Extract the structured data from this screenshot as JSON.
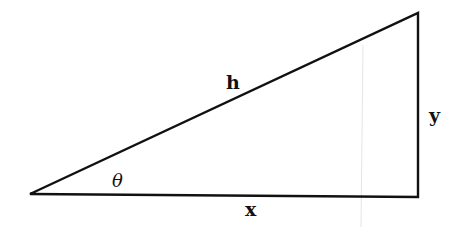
{
  "diagram": {
    "type": "right-triangle",
    "vertices": {
      "angle_vertex": [
        30,
        194
      ],
      "top_right": [
        418,
        13
      ],
      "right_angle": [
        418,
        197
      ]
    },
    "stroke_color": "#111111",
    "labels": {
      "hypotenuse": "h",
      "opposite": "y",
      "adjacent": "x",
      "angle": "θ"
    }
  }
}
